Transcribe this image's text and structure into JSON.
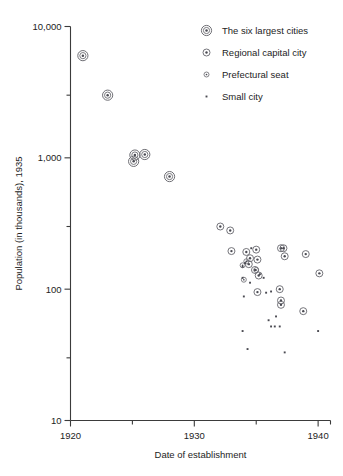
{
  "chart_data": {
    "type": "scatter",
    "title": "",
    "xlabel": "Date of establishment",
    "ylabel": "Population (in thousands), 1935",
    "xlim": [
      1920,
      1941
    ],
    "ylim": [
      10,
      10000
    ],
    "yscale": "log",
    "xticks": [
      1920,
      1930,
      1940
    ],
    "xticklabels": [
      "1920",
      "1930",
      "1940"
    ],
    "xminorticks": [
      1925,
      1935
    ],
    "yticks": [
      10,
      100,
      1000,
      10000
    ],
    "yticklabels": [
      "10",
      "100",
      "1,000",
      "10,000"
    ],
    "yminorticks": [
      30,
      300,
      3000
    ],
    "grid": false,
    "legend_position": "top-right",
    "series": [
      {
        "name": "The six largest cities",
        "marker": "large-bullseye",
        "points": [
          {
            "x": 1921.0,
            "y": 6000
          },
          {
            "x": 1923.0,
            "y": 3000
          },
          {
            "x": 1925.2,
            "y": 1050
          },
          {
            "x": 1925.1,
            "y": 940
          },
          {
            "x": 1926.0,
            "y": 1060
          },
          {
            "x": 1928.0,
            "y": 720
          }
        ]
      },
      {
        "name": "Regional capital city",
        "marker": "medium-bullseye",
        "points": [
          {
            "x": 1932.1,
            "y": 300
          },
          {
            "x": 1932.9,
            "y": 280
          },
          {
            "x": 1933.0,
            "y": 195
          },
          {
            "x": 1935.0,
            "y": 200
          },
          {
            "x": 1935.1,
            "y": 168
          },
          {
            "x": 1934.5,
            "y": 172
          },
          {
            "x": 1937.0,
            "y": 205
          },
          {
            "x": 1937.2,
            "y": 205
          },
          {
            "x": 1937.3,
            "y": 178
          },
          {
            "x": 1939.0,
            "y": 185
          },
          {
            "x": 1940.1,
            "y": 132
          },
          {
            "x": 1934.2,
            "y": 192
          },
          {
            "x": 1935.2,
            "y": 127
          },
          {
            "x": 1935.1,
            "y": 95
          },
          {
            "x": 1934.4,
            "y": 155
          },
          {
            "x": 1936.9,
            "y": 100
          },
          {
            "x": 1937.0,
            "y": 82
          },
          {
            "x": 1937.0,
            "y": 76
          },
          {
            "x": 1938.8,
            "y": 68
          },
          {
            "x": 1934.9,
            "y": 140
          }
        ]
      },
      {
        "name": "Prefectural seat",
        "marker": "small-circle",
        "points": [
          {
            "x": 1934.2,
            "y": 163
          },
          {
            "x": 1934.0,
            "y": 118
          },
          {
            "x": 1935.0,
            "y": 140
          },
          {
            "x": 1933.9,
            "y": 152
          }
        ]
      },
      {
        "name": "Small city",
        "marker": "dot",
        "points": [
          {
            "x": 1934.6,
            "y": 205
          },
          {
            "x": 1934.1,
            "y": 158
          },
          {
            "x": 1933.9,
            "y": 148
          },
          {
            "x": 1933.9,
            "y": 122
          },
          {
            "x": 1934.0,
            "y": 88
          },
          {
            "x": 1935.3,
            "y": 130
          },
          {
            "x": 1935.6,
            "y": 122
          },
          {
            "x": 1934.5,
            "y": 112
          },
          {
            "x": 1933.9,
            "y": 48
          },
          {
            "x": 1934.3,
            "y": 35
          },
          {
            "x": 1936.0,
            "y": 58
          },
          {
            "x": 1936.2,
            "y": 52
          },
          {
            "x": 1936.5,
            "y": 52
          },
          {
            "x": 1936.6,
            "y": 62
          },
          {
            "x": 1936.9,
            "y": 52
          },
          {
            "x": 1937.3,
            "y": 33
          },
          {
            "x": 1940.0,
            "y": 48
          },
          {
            "x": 1936.2,
            "y": 96
          },
          {
            "x": 1935.8,
            "y": 94
          }
        ]
      }
    ],
    "legend": [
      {
        "label": "The six largest cities",
        "marker": "large-bullseye"
      },
      {
        "label": "Regional capital city",
        "marker": "medium-bullseye"
      },
      {
        "label": "Prefectural seat",
        "marker": "small-circle"
      },
      {
        "label": "Small city",
        "marker": "dot"
      }
    ],
    "colors": {
      "axis": "#3b3b3b",
      "text": "#1d1d1d",
      "marker_stroke": "#6e6e74",
      "marker_fill": "#4a4a52",
      "background": "#ffffff"
    }
  }
}
